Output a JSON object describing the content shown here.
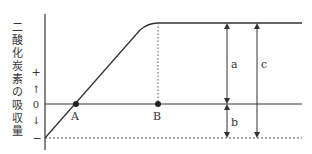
{
  "diagram": {
    "ylabel_chars": [
      "二",
      "酸",
      "化",
      "炭",
      "素",
      "の",
      "吸",
      "収",
      "量"
    ],
    "axis_marks": {
      "plus": "+",
      "up_arrow": "↑",
      "zero": "0",
      "down_arrow": "↓",
      "minus": "−"
    },
    "points": {
      "A": "A",
      "B": "B"
    },
    "arrows": {
      "a": "a",
      "b": "b",
      "c": "c"
    },
    "colors": {
      "line": "#333333",
      "background": "#ffffff"
    }
  }
}
